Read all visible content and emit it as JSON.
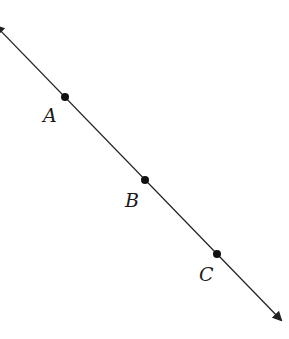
{
  "diagram": {
    "type": "line-with-points",
    "line": {
      "start": [
        0,
        30
      ],
      "end": [
        281,
        320
      ],
      "arrow_start": true,
      "arrow_end": true,
      "color": "#222222"
    },
    "points": [
      {
        "label": "A",
        "x": 65,
        "y": 97,
        "label_x": 43,
        "label_y": 108
      },
      {
        "label": "B",
        "x": 145,
        "y": 180,
        "label_x": 125,
        "label_y": 192
      },
      {
        "label": "C",
        "x": 217,
        "y": 254,
        "label_x": 199,
        "label_y": 266
      }
    ]
  }
}
